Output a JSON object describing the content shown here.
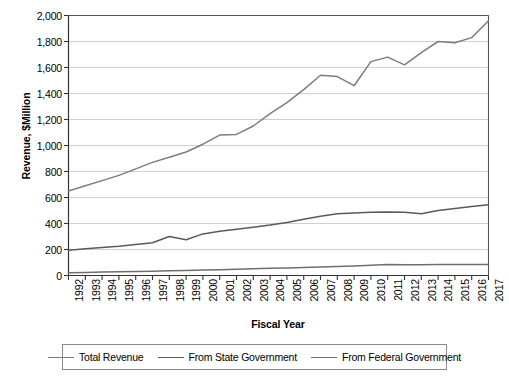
{
  "chart_data": {
    "type": "line",
    "title": "",
    "xlabel": "Fiscal Year",
    "ylabel": "Revenue, $Million",
    "ylim": [
      0,
      2000
    ],
    "y_ticks": [
      0,
      200,
      400,
      600,
      800,
      1000,
      1200,
      1400,
      1600,
      1800,
      2000
    ],
    "y_tick_labels": [
      "0",
      "200",
      "400",
      "600",
      "800",
      "1,000",
      "1,200",
      "1,400",
      "1,600",
      "1,800",
      "2,000"
    ],
    "grid": true,
    "legend_position": "bottom",
    "categories": [
      "1992",
      "1993",
      "1994",
      "1995",
      "1996",
      "1997",
      "1998",
      "1999",
      "2000",
      "2001",
      "2002",
      "2003",
      "2004",
      "2005",
      "2006",
      "2007",
      "2008",
      "2009",
      "2010",
      "2011",
      "2012",
      "2013",
      "2014",
      "2015",
      "2016",
      "2017"
    ],
    "series": [
      {
        "name": "Total Revenue",
        "color": "#7d7d7d",
        "values": [
          650,
          690,
          730,
          770,
          820,
          870,
          910,
          950,
          1010,
          1080,
          1085,
          1150,
          1245,
          1330,
          1430,
          1540,
          1530,
          1460,
          1645,
          1680,
          1620,
          1715,
          1800,
          1790,
          1830,
          1960
        ]
      },
      {
        "name": "From State Government",
        "color": "#5a5a5a",
        "values": [
          195,
          205,
          215,
          225,
          238,
          252,
          300,
          275,
          320,
          340,
          355,
          372,
          388,
          408,
          432,
          455,
          475,
          480,
          487,
          489,
          486,
          475,
          500,
          515,
          530,
          545
        ]
      },
      {
        "name": "From Federal Government",
        "color": "#6e6e6e",
        "values": [
          22,
          24,
          26,
          28,
          30,
          33,
          36,
          38,
          42,
          45,
          48,
          51,
          55,
          58,
          62,
          66,
          70,
          74,
          78,
          84,
          83,
          83,
          84,
          84,
          85,
          85
        ]
      }
    ]
  },
  "legend": {
    "items": [
      {
        "label": "Total Revenue"
      },
      {
        "label": "From State Government"
      },
      {
        "label": "From Federal Government"
      }
    ]
  },
  "axes": {
    "y_title": "Revenue, $Million",
    "x_title": "Fiscal Year"
  }
}
